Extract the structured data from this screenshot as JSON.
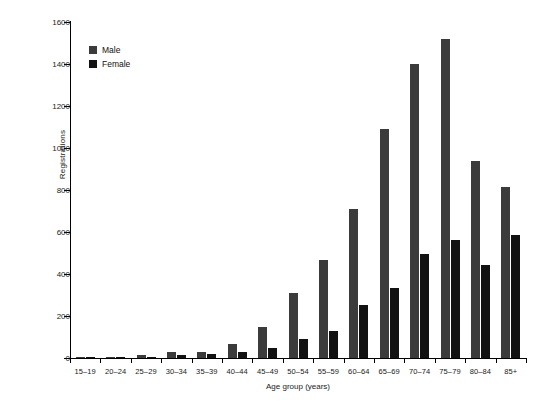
{
  "chart_data": {
    "type": "bar",
    "title": "",
    "subtitle": "",
    "xlabel": "Age group (years)",
    "ylabel": "Registrations",
    "ylim": [
      0,
      1600
    ],
    "ytick_step": 200,
    "yticks": [
      0,
      200,
      400,
      600,
      800,
      1000,
      1200,
      1400,
      1600
    ],
    "grid": false,
    "legend_position": "top-left",
    "categories": [
      "15–19",
      "20–24",
      "25–29",
      "30–34",
      "35–39",
      "40–44",
      "45–49",
      "50–54",
      "55–59",
      "60–64",
      "65–69",
      "70–74",
      "75–79",
      "80–84",
      "85+"
    ],
    "series": [
      {
        "name": "Male",
        "color": "#3b3b3b",
        "values": [
          2,
          4,
          12,
          27,
          30,
          65,
          150,
          310,
          465,
          710,
          1090,
          1400,
          1520,
          940,
          815
        ]
      },
      {
        "name": "Female",
        "color": "#121212",
        "values": [
          1,
          3,
          7,
          16,
          19,
          28,
          50,
          92,
          128,
          252,
          332,
          495,
          562,
          442,
          588
        ]
      }
    ]
  },
  "legend": {
    "items": [
      {
        "label": "Male",
        "color": "#3b3b3b"
      },
      {
        "label": "Female",
        "color": "#121212"
      }
    ]
  },
  "axes": {
    "y_title": "Registrations",
    "x_title": "Age group (years)"
  }
}
